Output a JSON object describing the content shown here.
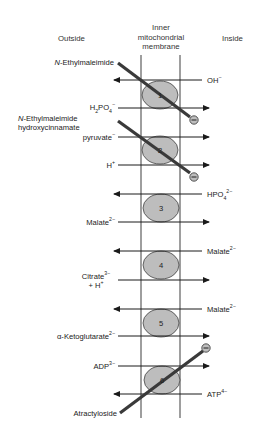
{
  "headers": {
    "outside": "Outside",
    "membrane_line1": "Inner",
    "membrane_line2": "mitochondrial",
    "membrane_line3": "membrane",
    "inside": "Inside"
  },
  "transporters": [
    {
      "id": "1",
      "label": "1"
    },
    {
      "id": "2",
      "label": "2"
    },
    {
      "id": "3",
      "label": "3"
    },
    {
      "id": "4",
      "label": "4"
    },
    {
      "id": "5",
      "label": "5"
    },
    {
      "id": "6",
      "label": "6"
    }
  ],
  "inhibitors": {
    "nem_1": {
      "text": "N-Ethylmaleimide",
      "italic_prefix": "N",
      "rest": "-Ethylmaleimide"
    },
    "nem_2_line1": {
      "italic_prefix": "N",
      "rest": "-Ethylmaleimide"
    },
    "nem_2_line2": "hydroxycinnamate",
    "atractyloside": "Atractyloside"
  },
  "substrates": {
    "oh": {
      "base": "OH",
      "sup": "−",
      "side": "inside",
      "direction": "out"
    },
    "h2po4": {
      "base1": "H",
      "sub1": "2",
      "base2": "PO",
      "sub2": "4",
      "sup": "−",
      "side": "outside",
      "direction": "in"
    },
    "pyruvate": {
      "base": "pyruvate",
      "sup": "−",
      "side": "outside",
      "direction": "in"
    },
    "h": {
      "base": "H",
      "sup": "+",
      "side": "outside",
      "direction": "in"
    },
    "hpo4": {
      "base": "HPO",
      "sub": "4",
      "sup": "2−",
      "side": "inside",
      "direction": "out"
    },
    "malate_in": {
      "base": "Malate",
      "sup": "2−",
      "side": "outside",
      "direction": "in"
    },
    "malate_out_4": {
      "base": "Malate",
      "sup": "2−",
      "side": "inside",
      "direction": "out"
    },
    "citrate": {
      "base": "Citrate",
      "sup": "3−",
      "line2_base": "+ H",
      "line2_sup": "+",
      "side": "outside",
      "direction": "in"
    },
    "malate_out_5": {
      "base": "Malate",
      "sup": "2−",
      "side": "inside",
      "direction": "out"
    },
    "akg": {
      "base": "α-Ketoglutarate",
      "sup": "2−",
      "side": "outside",
      "direction": "in"
    },
    "adp": {
      "base": "ADP",
      "sup": "3−",
      "side": "outside",
      "direction": "in"
    },
    "atp": {
      "base": "ATP",
      "sup": "4−",
      "side": "inside",
      "direction": "out"
    }
  },
  "inhibitor_symbol": "−",
  "colors": {
    "membrane": "#6a6a6a",
    "transporter_fill": "#bdbdbd",
    "transporter_stroke": "#444444",
    "inhibitor_bar": "#3a3a3a",
    "arrow": "#1a1a1a",
    "text": "#222222"
  }
}
